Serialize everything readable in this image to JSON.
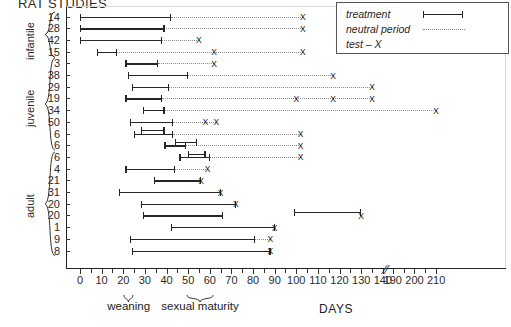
{
  "title": "RAT STUDIES",
  "legend": {
    "items": [
      {
        "label": "treatment",
        "style": "solid-bar"
      },
      {
        "label": "neutral period",
        "style": "dotted-line"
      },
      {
        "label": "test – X",
        "style": "x-mark"
      }
    ]
  },
  "axis": {
    "label": "DAYS",
    "ticks": [
      0,
      10,
      20,
      30,
      40,
      50,
      60,
      70,
      80,
      90,
      100,
      110,
      120,
      130,
      140,
      190,
      200,
      210
    ],
    "minor_step": 5,
    "break_between": [
      140,
      190
    ],
    "annotations": [
      {
        "label": "weaning",
        "from": 20,
        "to": 25
      },
      {
        "label": "sexual maturity",
        "from": 49,
        "to": 62
      }
    ]
  },
  "groups": [
    {
      "name": "infantile",
      "rows": [
        0,
        3
      ]
    },
    {
      "name": "juvenile",
      "rows": [
        4,
        11
      ]
    },
    {
      "name": "adult",
      "rows": [
        12,
        20
      ]
    }
  ],
  "chart_data": {
    "type": "timeline",
    "title": "RAT STUDIES",
    "xlabel": "DAYS",
    "ylabel": "",
    "xlim": [
      0,
      210
    ],
    "grid": false,
    "legend_position": "top-right",
    "categories": [
      "14",
      "28",
      "42",
      "15",
      "3",
      "38",
      "29",
      "19",
      "34",
      "50",
      "6",
      "6",
      "6",
      "4",
      "21",
      "31",
      "20",
      "20",
      "1",
      "9",
      "8"
    ],
    "rows": [
      {
        "id": "14",
        "group": "infantile",
        "treatments": [
          [
            0,
            42
          ]
        ],
        "neutral": [
          [
            42,
            103
          ]
        ],
        "tests": [
          103
        ]
      },
      {
        "id": "28",
        "group": "infantile",
        "treatments": [
          [
            0,
            39
          ]
        ],
        "neutral": [
          [
            39,
            103
          ]
        ],
        "tests": [
          103
        ]
      },
      {
        "id": "42",
        "group": "infantile",
        "treatments": [
          [
            0,
            38
          ]
        ],
        "neutral": [
          [
            38,
            55
          ]
        ],
        "tests": [
          55
        ]
      },
      {
        "id": "15",
        "group": "infantile",
        "treatments": [
          [
            8,
            17
          ]
        ],
        "neutral": [
          [
            17,
            62
          ],
          [
            62,
            103
          ]
        ],
        "tests": [
          62,
          103
        ]
      },
      {
        "id": "3",
        "group": "juvenile",
        "treatments": [
          [
            21,
            36
          ]
        ],
        "neutral": [
          [
            36,
            62
          ]
        ],
        "tests": [
          62
        ]
      },
      {
        "id": "38",
        "group": "juvenile",
        "treatments": [
          [
            22,
            50
          ]
        ],
        "neutral": [
          [
            50,
            117
          ]
        ],
        "tests": [
          117
        ]
      },
      {
        "id": "29",
        "group": "juvenile",
        "treatments": [
          [
            24,
            41
          ]
        ],
        "neutral": [
          [
            41,
            135
          ]
        ],
        "tests": [
          135
        ]
      },
      {
        "id": "19",
        "group": "juvenile",
        "treatments": [
          [
            21,
            38
          ]
        ],
        "neutral": [
          [
            38,
            100
          ],
          [
            100,
            117
          ],
          [
            117,
            135
          ]
        ],
        "tests": [
          100,
          117,
          135
        ]
      },
      {
        "id": "34",
        "group": "juvenile",
        "treatments": [
          [
            29,
            39
          ]
        ],
        "neutral": [
          [
            39,
            210
          ]
        ],
        "tests": [
          210
        ]
      },
      {
        "id": "50",
        "group": "juvenile",
        "treatments": [
          [
            23,
            43
          ]
        ],
        "neutral": [
          [
            43,
            58
          ],
          [
            58,
            63
          ]
        ],
        "tests": [
          58,
          63
        ]
      },
      {
        "id": "6",
        "group": "juvenile",
        "treatments": [
          [
            25,
            43
          ],
          [
            28,
            39
          ]
        ],
        "neutral": [
          [
            43,
            102
          ]
        ],
        "tests": [
          102
        ]
      },
      {
        "id": "6",
        "group": "juvenile",
        "treatments": [
          [
            39,
            49
          ],
          [
            44,
            54
          ]
        ],
        "neutral": [
          [
            49,
            102
          ]
        ],
        "tests": [
          102
        ]
      },
      {
        "id": "6",
        "group": "adult",
        "treatments": [
          [
            46,
            60
          ],
          [
            50,
            58
          ]
        ],
        "neutral": [
          [
            60,
            102
          ]
        ],
        "tests": [
          102
        ]
      },
      {
        "id": "4",
        "group": "adult",
        "treatments": [
          [
            21,
            44
          ]
        ],
        "neutral": [
          [
            44,
            59
          ]
        ],
        "tests": [
          59
        ]
      },
      {
        "id": "21",
        "group": "adult",
        "treatments": [
          [
            34,
            56
          ]
        ],
        "neutral": [],
        "tests": [
          56
        ]
      },
      {
        "id": "31",
        "group": "adult",
        "treatments": [
          [
            18,
            65
          ]
        ],
        "neutral": [],
        "tests": [
          65
        ]
      },
      {
        "id": "20",
        "group": "adult",
        "treatments": [
          [
            28,
            72
          ]
        ],
        "neutral": [],
        "tests": [
          72
        ]
      },
      {
        "id": "20",
        "group": "adult",
        "treatments": [
          [
            29,
            66
          ],
          [
            99,
            130
          ]
        ],
        "neutral": [],
        "tests": [
          130
        ]
      },
      {
        "id": "1",
        "group": "adult",
        "treatments": [
          [
            42,
            90
          ]
        ],
        "neutral": [],
        "tests": [
          90
        ]
      },
      {
        "id": "9",
        "group": "adult",
        "treatments": [
          [
            23,
            81
          ]
        ],
        "neutral": [
          [
            81,
            88
          ]
        ],
        "tests": [
          88
        ]
      },
      {
        "id": "8",
        "group": "adult",
        "treatments": [
          [
            24,
            88
          ]
        ],
        "neutral": [],
        "tests": [
          88
        ]
      }
    ]
  }
}
